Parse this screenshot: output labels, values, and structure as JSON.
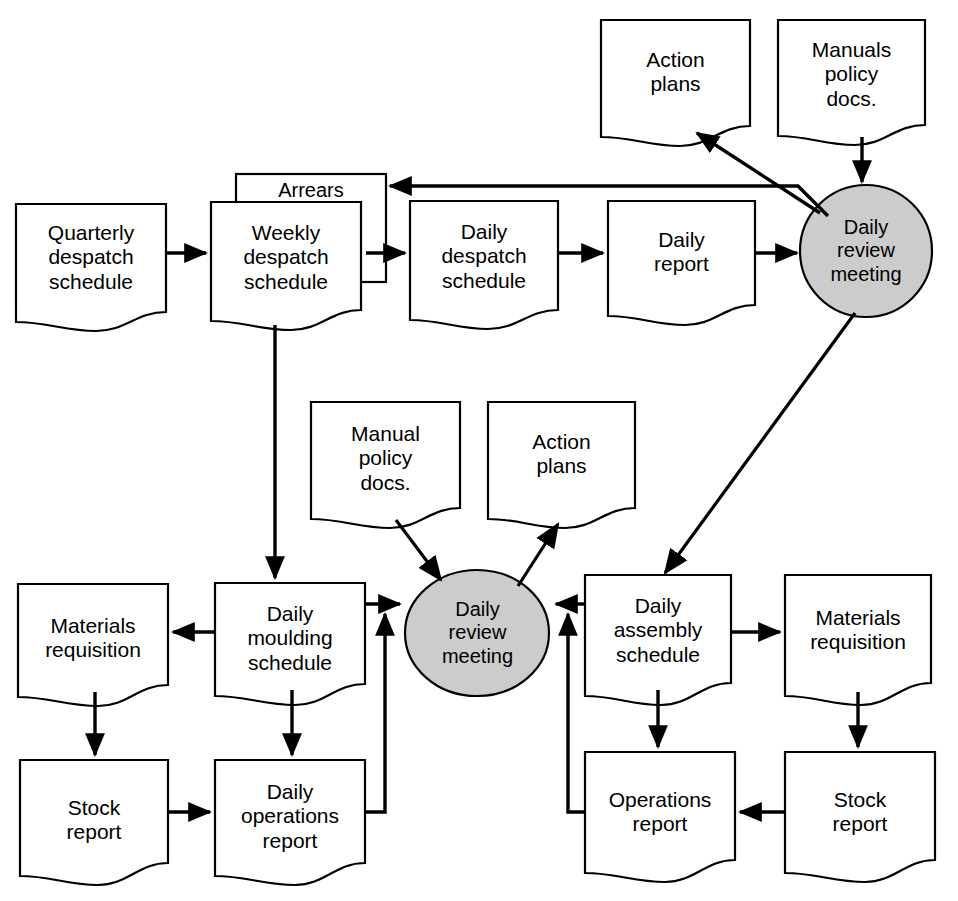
{
  "diagram": {
    "colors": {
      "stroke": "#000000",
      "fill_document": "#ffffff",
      "fill_process": "#c9c9c9",
      "text": "#000000"
    },
    "nodes": [
      {
        "id": "quarterly-despatch-schedule",
        "label": "Quarterly\ndespatch\nschedule",
        "shape": "document",
        "x": 16,
        "y": 204,
        "w": 150,
        "h": 126
      },
      {
        "id": "arrears",
        "label": "Arrears",
        "shape": "rectangle",
        "x": 236,
        "y": 174,
        "w": 150,
        "h": 108
      },
      {
        "id": "weekly-despatch-schedule",
        "label": "Weekly\ndespatch\nschedule",
        "shape": "document",
        "x": 211,
        "y": 202,
        "w": 150,
        "h": 128
      },
      {
        "id": "daily-despatch-schedule",
        "label": "Daily\ndespatch\nschedule",
        "shape": "document",
        "x": 410,
        "y": 201,
        "w": 148,
        "h": 128
      },
      {
        "id": "daily-report",
        "label": "Daily\nreport",
        "shape": "document",
        "x": 608,
        "y": 201,
        "w": 147,
        "h": 124
      },
      {
        "id": "action-plans-top",
        "label": "Action\nplans",
        "shape": "document",
        "x": 601,
        "y": 20,
        "w": 149,
        "h": 126
      },
      {
        "id": "manuals-policy-docs-top",
        "label": "Manuals\npolicy\ndocs.",
        "shape": "document",
        "x": 778,
        "y": 20,
        "w": 147,
        "h": 125
      },
      {
        "id": "daily-review-meeting-top",
        "label": "Daily\nreview\nmeeting",
        "shape": "ellipse",
        "x": 800,
        "y": 185,
        "w": 132,
        "h": 132
      },
      {
        "id": "manual-policy-docs-mid",
        "label": "Manual\npolicy\ndocs.",
        "shape": "document",
        "x": 311,
        "y": 402,
        "w": 149,
        "h": 126
      },
      {
        "id": "action-plans-mid",
        "label": "Action\nplans",
        "shape": "document",
        "x": 488,
        "y": 402,
        "w": 147,
        "h": 126
      },
      {
        "id": "daily-review-meeting-bottom",
        "label": "Daily\nreview\nmeeting",
        "shape": "ellipse",
        "x": 405,
        "y": 570,
        "w": 145,
        "h": 126
      },
      {
        "id": "materials-requisition-left",
        "label": "Materials\nrequisition",
        "shape": "document",
        "x": 18,
        "y": 584,
        "w": 150,
        "h": 122
      },
      {
        "id": "daily-moulding-schedule",
        "label": "Daily\nmoulding\nschedule",
        "shape": "document",
        "x": 215,
        "y": 583,
        "w": 150,
        "h": 123
      },
      {
        "id": "daily-assembly-schedule",
        "label": "Daily\nassembly\nschedule",
        "shape": "document",
        "x": 585,
        "y": 575,
        "w": 146,
        "h": 131
      },
      {
        "id": "materials-requisition-right",
        "label": "Materials\nrequisition",
        "shape": "document",
        "x": 785,
        "y": 575,
        "w": 146,
        "h": 131
      },
      {
        "id": "stock-report-left",
        "label": "Stock\nreport",
        "shape": "document",
        "x": 20,
        "y": 760,
        "w": 148,
        "h": 125
      },
      {
        "id": "daily-operations-report",
        "label": "Daily\noperations\nreport",
        "shape": "document",
        "x": 215,
        "y": 760,
        "w": 150,
        "h": 125
      },
      {
        "id": "operations-report",
        "label": "Operations\nreport",
        "shape": "document",
        "x": 585,
        "y": 752,
        "w": 150,
        "h": 133
      },
      {
        "id": "stock-report-right",
        "label": "Stock\nreport",
        "shape": "document",
        "x": 785,
        "y": 752,
        "w": 150,
        "h": 133
      }
    ],
    "edges": [
      {
        "id": "quarterly-to-weekly",
        "from": "quarterly-despatch-schedule",
        "to": "weekly-despatch-schedule"
      },
      {
        "id": "weekly-to-daily-despatch",
        "from": "weekly-despatch-schedule",
        "to": "daily-despatch-schedule"
      },
      {
        "id": "daily-despatch-to-daily-report",
        "from": "daily-despatch-schedule",
        "to": "daily-report"
      },
      {
        "id": "daily-report-to-meeting-top",
        "from": "daily-report",
        "to": "daily-review-meeting-top"
      },
      {
        "id": "manuals-to-meeting-top",
        "from": "manuals-policy-docs-top",
        "to": "daily-review-meeting-top"
      },
      {
        "id": "meeting-top-to-action-plans",
        "from": "daily-review-meeting-top",
        "to": "action-plans-top"
      },
      {
        "id": "meeting-top-to-arrears",
        "from": "daily-review-meeting-top",
        "to": "arrears"
      },
      {
        "id": "meeting-top-to-daily-assembly",
        "from": "daily-review-meeting-top",
        "to": "daily-assembly-schedule"
      },
      {
        "id": "weekly-to-daily-moulding",
        "from": "weekly-despatch-schedule",
        "to": "daily-moulding-schedule"
      },
      {
        "id": "manual-policy-to-meeting-bottom",
        "from": "manual-policy-docs-mid",
        "to": "daily-review-meeting-bottom"
      },
      {
        "id": "meeting-bottom-to-action-plans",
        "from": "daily-review-meeting-bottom",
        "to": "action-plans-mid"
      },
      {
        "id": "daily-moulding-to-meeting-bottom",
        "from": "daily-moulding-schedule",
        "to": "daily-review-meeting-bottom"
      },
      {
        "id": "daily-assembly-to-meeting-bottom",
        "from": "daily-assembly-schedule",
        "to": "daily-review-meeting-bottom"
      },
      {
        "id": "daily-moulding-to-materials-left",
        "from": "daily-moulding-schedule",
        "to": "materials-requisition-left"
      },
      {
        "id": "daily-assembly-to-materials-right",
        "from": "daily-assembly-schedule",
        "to": "materials-requisition-right"
      },
      {
        "id": "materials-left-to-stock-left",
        "from": "materials-requisition-left",
        "to": "stock-report-left"
      },
      {
        "id": "materials-right-to-stock-right",
        "from": "materials-requisition-right",
        "to": "stock-report-right"
      },
      {
        "id": "daily-moulding-to-daily-operations",
        "from": "daily-moulding-schedule",
        "to": "daily-operations-report"
      },
      {
        "id": "daily-assembly-to-operations",
        "from": "daily-assembly-schedule",
        "to": "operations-report"
      },
      {
        "id": "stock-left-to-daily-operations",
        "from": "stock-report-left",
        "to": "daily-operations-report"
      },
      {
        "id": "stock-right-to-operations",
        "from": "stock-report-right",
        "to": "operations-report"
      },
      {
        "id": "daily-operations-feedback",
        "from": "daily-operations-report",
        "to": "daily-moulding-schedule"
      },
      {
        "id": "operations-feedback",
        "from": "operations-report",
        "to": "daily-assembly-schedule"
      }
    ]
  }
}
